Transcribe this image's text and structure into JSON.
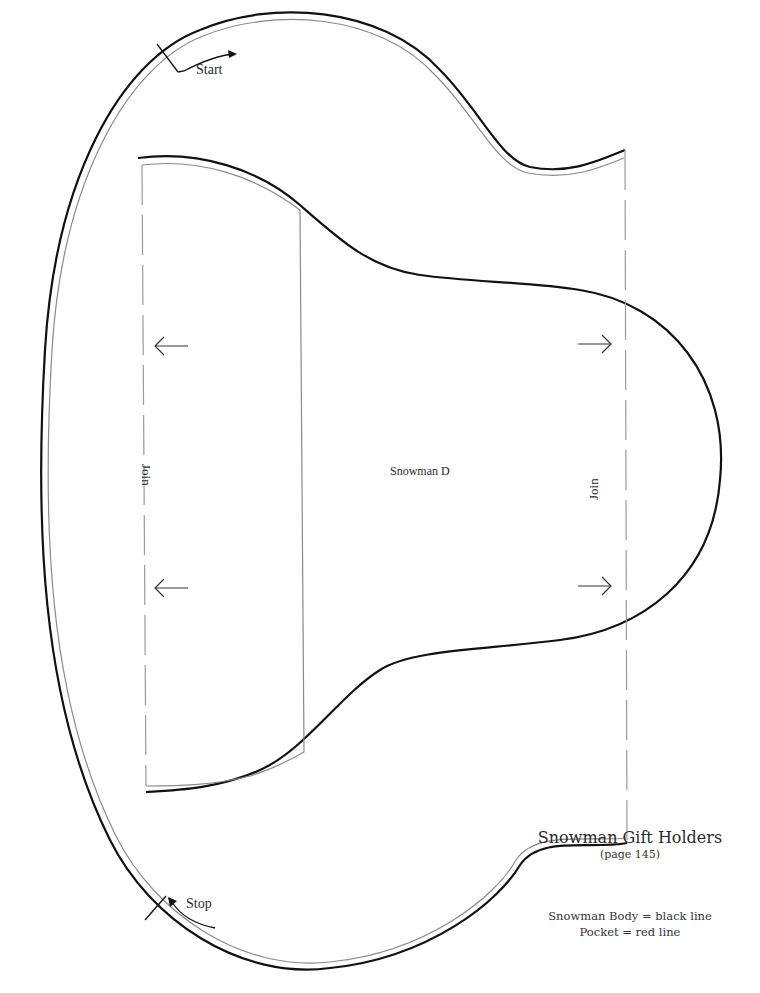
{
  "pattern": {
    "piece_name": "Snowman D",
    "start_label": "Start",
    "stop_label": "Stop",
    "join_left_label": "Join",
    "join_right_label": "Join",
    "title": "Snowman Gift Holders",
    "subtitle": "(page 145)",
    "legend": [
      "Snowman Body = black line",
      "Pocket = red line"
    ],
    "colors": {
      "body_line": "#111111",
      "pocket_line": "#8a8a8a",
      "join_dash": "#9a9a9a"
    }
  }
}
